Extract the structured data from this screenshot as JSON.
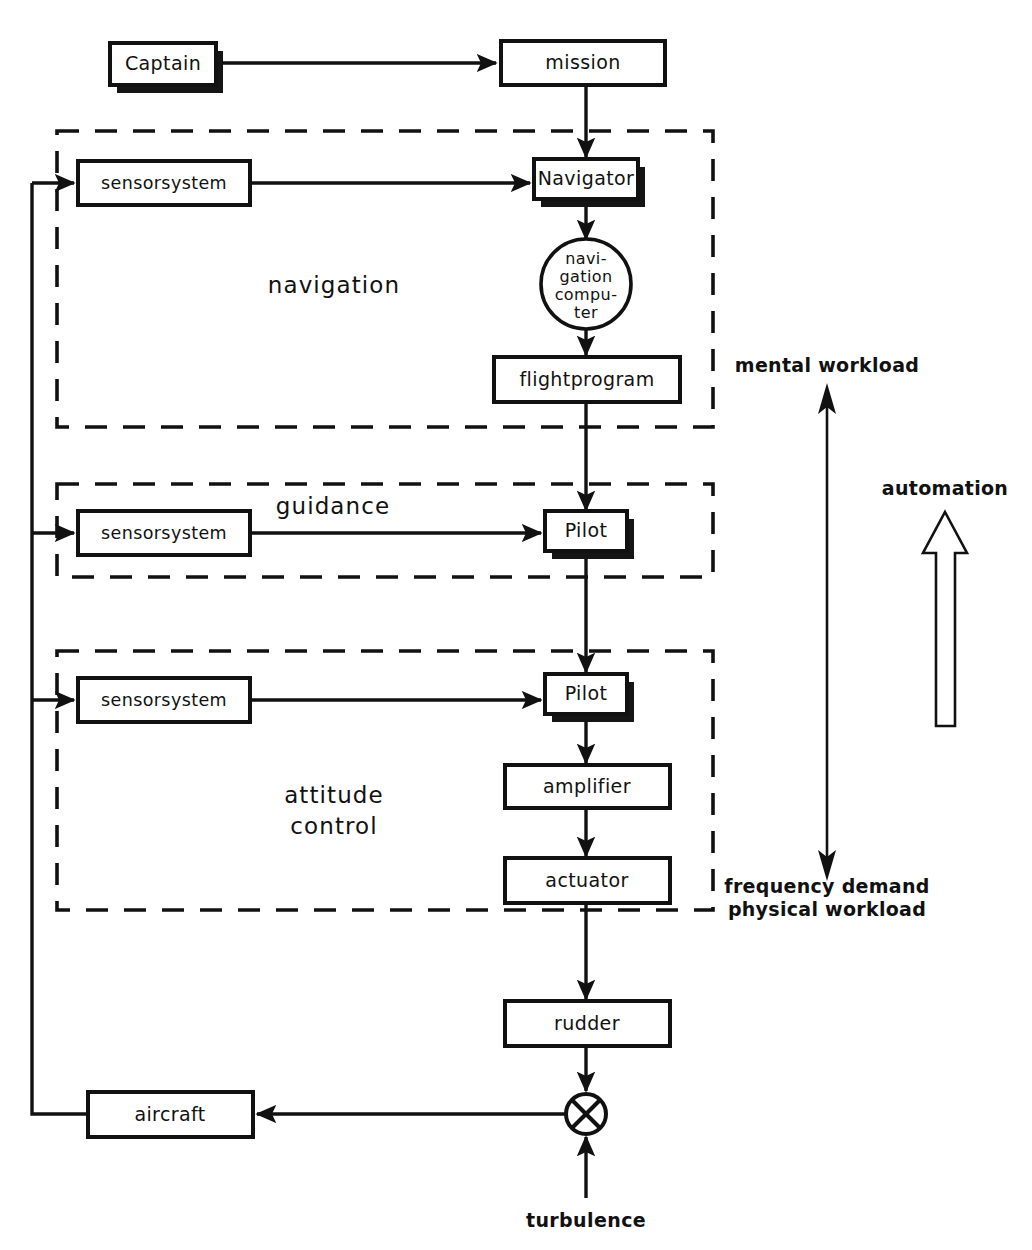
{
  "figure": {
    "background_color": "#ffffff",
    "line_color": "#111111"
  },
  "nodes": {
    "captain": {
      "label": "Captain",
      "shape": "box-shadowed"
    },
    "mission": {
      "label": "mission",
      "shape": "box"
    },
    "sensor_nav": {
      "label": "sensorsystem",
      "shape": "box"
    },
    "navigator": {
      "label": "Navigator",
      "shape": "box-shadowed"
    },
    "nav_computer": {
      "shape": "circle",
      "lines": [
        "navi-",
        "gation",
        "compu-",
        "ter"
      ],
      "line1": "navi-",
      "line2": "gation",
      "line3": "compu-",
      "line4": "ter"
    },
    "flightprogram": {
      "label": "flightprogram",
      "shape": "box"
    },
    "sensor_guid": {
      "label": "sensorsystem",
      "shape": "box"
    },
    "pilot_guid": {
      "label": "Pilot",
      "shape": "box-shadowed"
    },
    "sensor_att": {
      "label": "sensorsystem",
      "shape": "box"
    },
    "pilot_att": {
      "label": "Pilot",
      "shape": "box-shadowed"
    },
    "amplifier": {
      "label": "amplifier",
      "shape": "box"
    },
    "actuator": {
      "label": "actuator",
      "shape": "box"
    },
    "rudder": {
      "label": "rudder",
      "shape": "box"
    },
    "aircraft": {
      "label": "aircraft",
      "shape": "box"
    },
    "summing_junction": {
      "label": "",
      "shape": "circle-with-cross"
    }
  },
  "groups": {
    "navigation": {
      "label": "navigation"
    },
    "guidance": {
      "label": "guidance"
    },
    "attitude_control": {
      "label_line1": "attitude",
      "label_line2": "control"
    }
  },
  "annotations": {
    "mental_workload": "mental workload",
    "frequency_demand": "frequency demand",
    "physical_workload": "physical workload",
    "automation": "automation",
    "turbulence": "turbulence"
  }
}
